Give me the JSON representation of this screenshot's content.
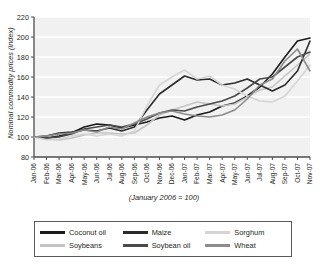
{
  "chart_data": {
    "type": "line",
    "title": "",
    "subtitle": "",
    "note": "(January 2006 = 100)",
    "xlabel": "",
    "ylabel": "Nominal commodity prices (index)",
    "ylim": [
      80,
      220
    ],
    "yticks": [
      80,
      100,
      120,
      140,
      160,
      180,
      200,
      220
    ],
    "grid": true,
    "legend_position": "bottom",
    "categories": [
      "Jan-06",
      "Feb-06",
      "Mar-06",
      "Apr-06",
      "May-06",
      "Jun-06",
      "Jul-06",
      "Aug-06",
      "Sep-06",
      "Oct-06",
      "Nov-06",
      "Dec-06",
      "Jan-07",
      "Feb-07",
      "Mar-07",
      "Apr-07",
      "May-07",
      "Jun-07",
      "Jul-07",
      "Aug-07",
      "Sep-07",
      "Oct-07",
      "Nov-07"
    ],
    "series": [
      {
        "name": "Coconut oil",
        "color": "#1a1a1a",
        "values": [
          100,
          99,
          101,
          104,
          110,
          113,
          112,
          109,
          112,
          115,
          119,
          121,
          117,
          122,
          125,
          131,
          134,
          141,
          150,
          163,
          180,
          196,
          199
        ]
      },
      {
        "name": "Soybeans",
        "color": "#c4c4c4",
        "values": [
          100,
          98,
          97,
          99,
          102,
          104,
          104,
          103,
          104,
          112,
          122,
          127,
          131,
          135,
          133,
          131,
          133,
          140,
          147,
          150,
          161,
          172,
          183
        ]
      },
      {
        "name": "Maize",
        "color": "#2b2b2b",
        "values": [
          100,
          101,
          104,
          105,
          107,
          106,
          109,
          106,
          110,
          127,
          143,
          152,
          161,
          157,
          158,
          152,
          154,
          158,
          152,
          146,
          152,
          166,
          196
        ]
      },
      {
        "name": "Soybean oil",
        "color": "#4a4a4a",
        "values": [
          100,
          99,
          100,
          103,
          108,
          110,
          112,
          110,
          113,
          118,
          124,
          127,
          126,
          130,
          133,
          136,
          141,
          149,
          158,
          160,
          170,
          180,
          185
        ]
      },
      {
        "name": "Sorghum",
        "color": "#d5d5d5",
        "values": [
          100,
          97,
          98,
          101,
          103,
          101,
          103,
          101,
          106,
          131,
          152,
          160,
          167,
          158,
          161,
          152,
          148,
          141,
          136,
          135,
          141,
          156,
          172
        ]
      },
      {
        "name": "Wheat",
        "color": "#8c8c8c",
        "values": [
          100,
          101,
          103,
          104,
          107,
          105,
          110,
          108,
          114,
          120,
          124,
          126,
          123,
          121,
          120,
          122,
          127,
          138,
          152,
          158,
          176,
          188,
          166
        ]
      }
    ]
  }
}
